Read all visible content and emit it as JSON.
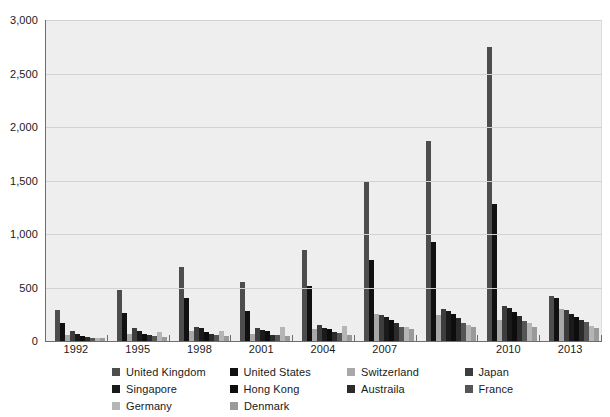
{
  "chart_data": {
    "type": "bar",
    "title": "",
    "subtitle": "",
    "xlabel": "",
    "ylabel": "",
    "ylim": [
      0,
      3000
    ],
    "ytick_labels": [
      "3,000",
      "2,500",
      "2,000",
      "1,500",
      "1,000",
      "500",
      "0"
    ],
    "ytick_values": [
      3000,
      2500,
      2000,
      1500,
      1000,
      500,
      0
    ],
    "grid": true,
    "legend_position": "bottom",
    "categories": [
      "1992",
      "1995",
      "1998",
      "2001",
      "2004",
      "2007",
      "",
      "2010",
      "2013"
    ],
    "category_labels_visible": [
      "1992",
      "1995",
      "1998",
      "2001",
      "2004",
      "2007",
      "",
      "2010",
      "2013"
    ],
    "series": [
      {
        "name": "United Kingdom",
        "color": "#4d4d4d",
        "values": [
          290,
          480,
          690,
          550,
          850,
          1500,
          1870,
          2750,
          420
        ]
      },
      {
        "name": "United States",
        "color": "#111111",
        "values": [
          165,
          260,
          400,
          280,
          510,
          760,
          930,
          1280,
          400
        ]
      },
      {
        "name": "Switzerland",
        "color": "#a8a8a8",
        "values": [
          55,
          70,
          90,
          65,
          115,
          250,
          245,
          195,
          300
        ]
      },
      {
        "name": "Japan",
        "color": "#3d3d3d",
        "values": [
          95,
          120,
          135,
          120,
          150,
          245,
          300,
          330,
          290
        ]
      },
      {
        "name": "Singapore",
        "color": "#1a1a1a",
        "values": [
          70,
          95,
          120,
          105,
          125,
          225,
          285,
          310,
          255
        ]
      },
      {
        "name": "Hong Kong",
        "color": "#0d0d0d",
        "values": [
          45,
          70,
          85,
          90,
          110,
          195,
          250,
          270,
          225
        ]
      },
      {
        "name": "Austraila",
        "color": "#2b2b2b",
        "values": [
          35,
          55,
          65,
          60,
          80,
          170,
          215,
          230,
          195
        ]
      },
      {
        "name": "France",
        "color": "#555555",
        "values": [
          30,
          45,
          60,
          55,
          75,
          135,
          170,
          185,
          175
        ]
      },
      {
        "name": "Germany",
        "color": "#b5b5b5",
        "values": [
          28,
          80,
          95,
          130,
          140,
          130,
          150,
          165,
          140
        ]
      },
      {
        "name": "Denmark",
        "color": "#9a9a9a",
        "values": [
          25,
          40,
          50,
          45,
          60,
          110,
          130,
          135,
          120
        ]
      }
    ]
  },
  "legend": {
    "rows": [
      [
        {
          "label": "United Kingdom",
          "color": "#4d4d4d"
        },
        {
          "label": "United States",
          "color": "#111111"
        },
        {
          "label": "Switzerland",
          "color": "#a8a8a8"
        },
        {
          "label": "Japan",
          "color": "#3d3d3d"
        }
      ],
      [
        {
          "label": "Singapore",
          "color": "#1a1a1a"
        },
        {
          "label": "Hong Kong",
          "color": "#0d0d0d"
        },
        {
          "label": "Austraila",
          "color": "#2b2b2b"
        },
        {
          "label": "France",
          "color": "#555555"
        }
      ],
      [
        {
          "label": "Germany",
          "color": "#b5b5b5"
        },
        {
          "label": "Denmark",
          "color": "#9a9a9a"
        }
      ]
    ]
  },
  "colors": {
    "plot_background": "#eeeeee",
    "gridline": "#d2d2d2",
    "axis": "#6e6e6e",
    "text": "#1a1a1a",
    "page_background": "#ffffff"
  }
}
